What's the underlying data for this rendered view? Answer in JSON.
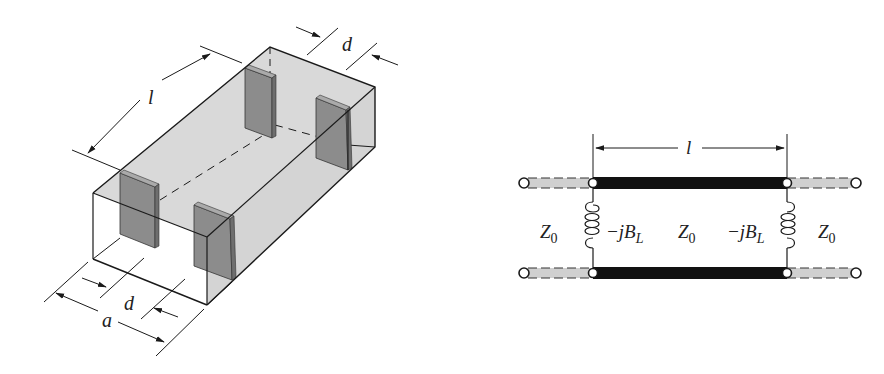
{
  "figure": {
    "left_panel": {
      "title": "Waveguide with two pairs of inductive diaphragms",
      "labels": {
        "length": "l",
        "diaphragm_width_top": "d",
        "diaphragm_width_bottom": "d",
        "guide_width": "a"
      }
    },
    "right_panel": {
      "title": "Equivalent transmission line circuit",
      "labels": {
        "length": "l",
        "z_left": "Z",
        "z_left_sub": "0",
        "z_mid": "Z",
        "z_mid_sub": "0",
        "z_right": "Z",
        "z_right_sub": "0",
        "shunt_left": "−jB",
        "shunt_left_sub": "L",
        "shunt_right": "−jB",
        "shunt_right_sub": "L"
      }
    },
    "colors": {
      "line": "#1a1a1a",
      "box_fill": "#d9d9d9",
      "plate_fill": "#8c8c8c",
      "plate_edge": "#6e6e6e",
      "outer_line_fill": "#d0d0d0",
      "section_line": "#111111"
    }
  }
}
